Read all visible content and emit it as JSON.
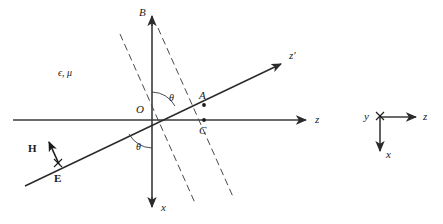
{
  "figure": {
    "caption": "",
    "background_color": "#ffffff",
    "line_color": "#2b2b2b",
    "dash_color": "#4a4a4a"
  },
  "main_diagram": {
    "medium_label": "ϵ, μ",
    "origin_label": "O",
    "axes": [
      {
        "name": "z-axis",
        "label": "z"
      },
      {
        "name": "x-axis",
        "label": "x"
      },
      {
        "name": "b-axis",
        "label": "B"
      },
      {
        "name": "z-prime-axis",
        "label": "z′"
      }
    ],
    "points": [
      {
        "name": "point-a",
        "label": "A"
      },
      {
        "name": "point-c",
        "label": "C"
      }
    ],
    "angles": [
      {
        "name": "angle-theta-upper",
        "label": "θ"
      },
      {
        "name": "angle-theta-lower",
        "label": "θ"
      }
    ],
    "vectors": [
      {
        "name": "vector-h",
        "label": "H"
      },
      {
        "name": "vector-e",
        "label": "E"
      }
    ],
    "wavefronts": {
      "name": "wavefront-dashed-lines",
      "count": 2
    }
  },
  "inset_axes": {
    "name": "inset-coordinate-triad",
    "labels": {
      "y": "y",
      "z": "z",
      "x": "x"
    }
  }
}
